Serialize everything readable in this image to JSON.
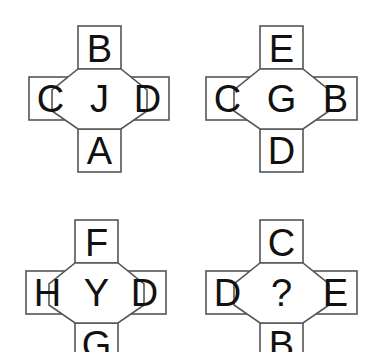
{
  "puzzle": {
    "type": "letter-cross-analogy",
    "background_color": "#ffffff",
    "line_color": "#555555",
    "text_color": "#111111",
    "figures": [
      {
        "id": "figure-1",
        "position": "top-left",
        "center": "J",
        "top": "B",
        "left": "C",
        "right": "D",
        "bottom": "A"
      },
      {
        "id": "figure-2",
        "position": "top-right",
        "center": "G",
        "top": "E",
        "left": "C",
        "right": "B",
        "bottom": "D"
      },
      {
        "id": "figure-3",
        "position": "bottom-left",
        "center": "Y",
        "top": "F",
        "left": "H",
        "right": "D",
        "bottom": "G"
      },
      {
        "id": "figure-4",
        "position": "bottom-right",
        "center": "?",
        "top": "C",
        "left": "D",
        "right": "E",
        "bottom": "B"
      }
    ]
  }
}
